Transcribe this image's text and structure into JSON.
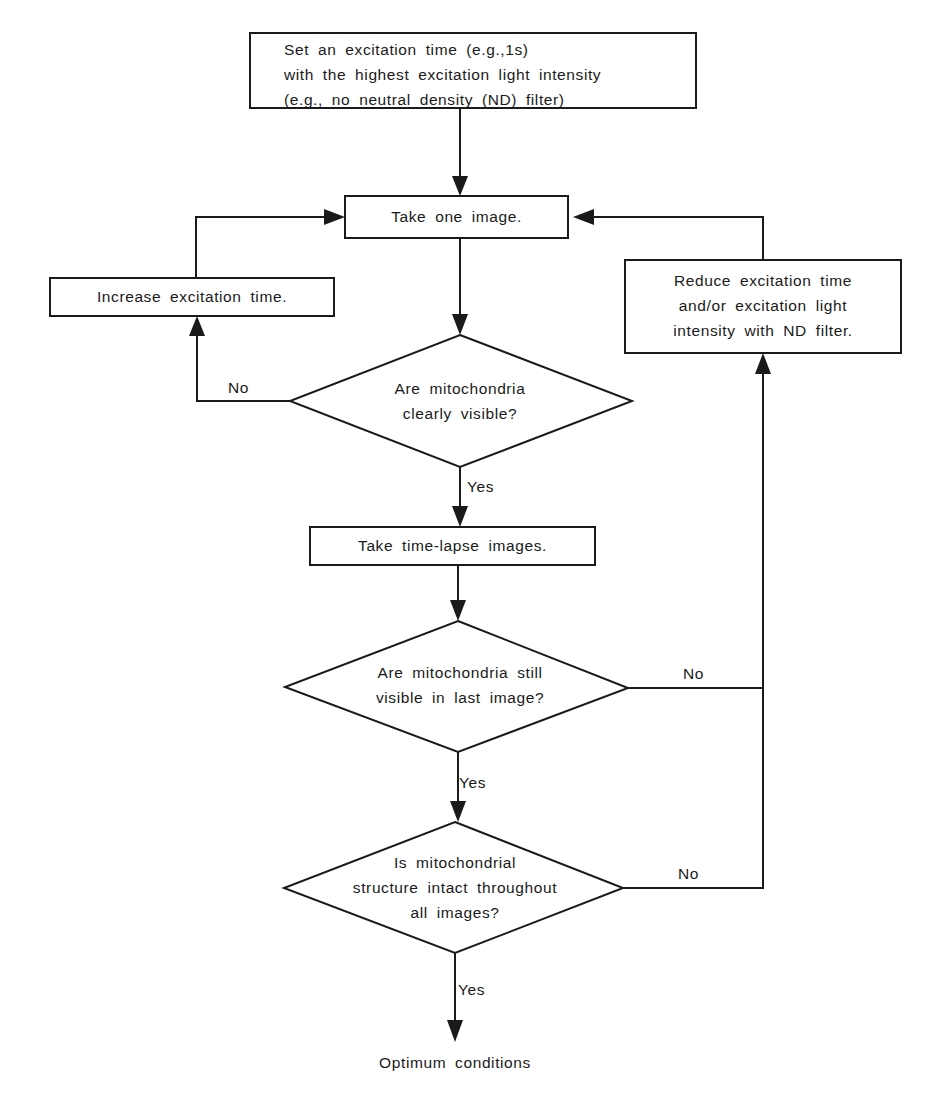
{
  "flowchart": {
    "start_box": {
      "text": "Set an excitation time (e.g.,1s)\nwith the highest excitation light intensity\n(e.g., no neutral density (ND) filter)"
    },
    "take_one_image": {
      "text": "Take one image."
    },
    "increase_time": {
      "text": "Increase excitation time."
    },
    "reduce_time": {
      "text": "Reduce excitation time\nand/or excitation light\nintensity with ND filter."
    },
    "decision_visible": {
      "text": "Are mitochondria\nclearly visible?"
    },
    "take_timelapse": {
      "text": "Take time-lapse images."
    },
    "decision_still_visible": {
      "text": "Are mitochondria still\nvisible in  last image?"
    },
    "decision_intact": {
      "text": "Is mitochondrial\nstructure intact throughout\nall images?"
    },
    "end": {
      "text": "Optimum conditions"
    },
    "labels": {
      "no_1": "No",
      "yes_1": "Yes",
      "no_2": "No",
      "yes_2": "Yes",
      "no_3": "No",
      "yes_3": "Yes"
    },
    "colors": {
      "stroke": "#1a1a1a",
      "background": "#ffffff"
    }
  }
}
